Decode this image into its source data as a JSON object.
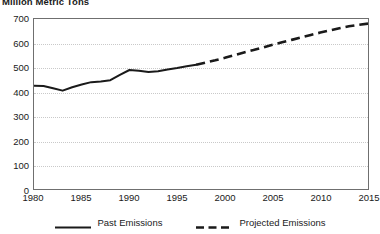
{
  "chart_data": {
    "type": "line",
    "title": "Million Metric Tons",
    "xlabel": "",
    "ylabel": "",
    "xlim": [
      1980,
      2015
    ],
    "ylim": [
      0,
      700
    ],
    "grid": true,
    "legend_position": "bottom",
    "y_ticks": [
      0,
      100,
      200,
      300,
      400,
      500,
      600,
      700
    ],
    "y_tick_labels": [
      "0",
      "100",
      "200",
      "300",
      "400",
      "500",
      "600",
      "700"
    ],
    "x_ticks": [
      1980,
      1985,
      1990,
      1995,
      2000,
      2005,
      2010,
      2015
    ],
    "x_tick_labels": [
      "1980",
      "1985",
      "1990",
      "1995",
      "2000",
      "2005",
      "2010",
      "2015"
    ],
    "series": [
      {
        "name": "Past Emissions",
        "style": "solid",
        "color": "#1a1a1a",
        "x": [
          1980,
          1981,
          1982,
          1983,
          1984,
          1985,
          1986,
          1987,
          1988,
          1989,
          1990,
          1991,
          1992,
          1993,
          1994,
          1995,
          1996,
          1997
        ],
        "values": [
          425,
          424,
          415,
          405,
          419,
          430,
          440,
          443,
          448,
          470,
          490,
          487,
          482,
          485,
          492,
          498,
          505,
          512
        ]
      },
      {
        "name": "Projected Emissions",
        "style": "dashed",
        "color": "#1a1a1a",
        "x": [
          1997,
          1998,
          1999,
          2000,
          2001,
          2002,
          2003,
          2004,
          2005,
          2006,
          2007,
          2008,
          2009,
          2010,
          2011,
          2012,
          2013,
          2014,
          2015
        ],
        "values": [
          512,
          521,
          530,
          540,
          551,
          562,
          572,
          583,
          594,
          604,
          614,
          624,
          634,
          644,
          653,
          662,
          670,
          676,
          681
        ]
      }
    ]
  },
  "legend": {
    "items": [
      {
        "label": "Past Emissions",
        "style": "solid"
      },
      {
        "label": "Projected Emissions",
        "style": "dashed"
      }
    ]
  }
}
